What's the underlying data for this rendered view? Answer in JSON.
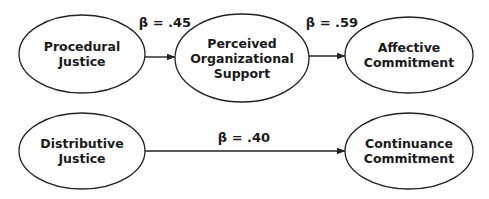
{
  "diagram": {
    "type": "path-model",
    "colors": {
      "stroke": "#222222",
      "text": "#1a1a1a",
      "background": "#ffffff"
    },
    "nodes": [
      {
        "id": "procedural_justice",
        "lines": [
          "Procedural",
          "Justice"
        ],
        "cx": 82,
        "cy": 54,
        "rx": 63,
        "ry": 39
      },
      {
        "id": "perceived_organizational_support",
        "lines": [
          "Perceived",
          "Organizational",
          "Support"
        ],
        "cx": 242,
        "cy": 58,
        "rx": 67,
        "ry": 44
      },
      {
        "id": "affective_commitment",
        "lines": [
          "Affective",
          "Commitment"
        ],
        "cx": 409,
        "cy": 55,
        "rx": 64,
        "ry": 38
      },
      {
        "id": "distributive_justice",
        "lines": [
          "Distributive",
          "Justice"
        ],
        "cx": 82,
        "cy": 151,
        "rx": 63,
        "ry": 38
      },
      {
        "id": "continuance_commitment",
        "lines": [
          "Continuance",
          "Commitment"
        ],
        "cx": 409,
        "cy": 151,
        "rx": 64,
        "ry": 38
      }
    ],
    "edges": [
      {
        "from": "procedural_justice",
        "to": "perceived_organizational_support",
        "label": "β = .45",
        "x1": 145,
        "y1": 57,
        "x2": 175,
        "y2": 57,
        "lx": 165,
        "ly": 27
      },
      {
        "from": "perceived_organizational_support",
        "to": "affective_commitment",
        "label": "β = .59",
        "x1": 309,
        "y1": 56,
        "x2": 345,
        "y2": 56,
        "lx": 332,
        "ly": 27
      },
      {
        "from": "distributive_justice",
        "to": "continuance_commitment",
        "label": "β = .40",
        "x1": 145,
        "y1": 151,
        "x2": 345,
        "y2": 151,
        "lx": 244,
        "ly": 142
      }
    ]
  }
}
